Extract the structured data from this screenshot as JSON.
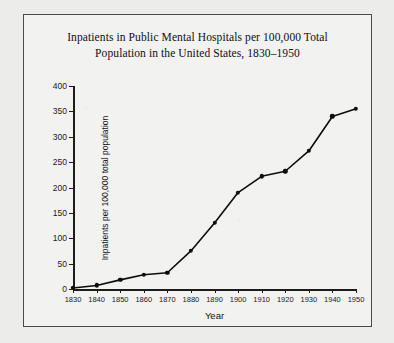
{
  "chart_data": {
    "type": "line",
    "title": "Inpatients in Public Mental Hospitals per 100,000 Total Population in the United States, 1830–1950",
    "title_lines": [
      "Inpatients in Public Mental Hospitals per 100,000 Total",
      "Population in the United States, 1830–1950"
    ],
    "xlabel": "Year",
    "ylabel": "Inpatients per 100,000 total population",
    "x": [
      1830,
      1840,
      1850,
      1860,
      1870,
      1880,
      1890,
      1900,
      1910,
      1920,
      1930,
      1940,
      1950
    ],
    "values": [
      2,
      7,
      18,
      28,
      32,
      75,
      130,
      190,
      222,
      232,
      272,
      340,
      355
    ],
    "xticks": [
      "1830",
      "1840",
      "1850",
      "1860",
      "1870",
      "1880",
      "1890",
      "1900",
      "1910",
      "1920",
      "1930",
      "1940",
      "1950"
    ],
    "yticks": [
      "0",
      "50",
      "100",
      "150",
      "200",
      "250",
      "300",
      "350",
      "400"
    ],
    "ytick_values": [
      0,
      50,
      100,
      150,
      200,
      250,
      300,
      350,
      400
    ],
    "xlim": [
      1830,
      1950
    ],
    "ylim": [
      0,
      400
    ],
    "grid": false,
    "legend": null,
    "marker": "filled-circle",
    "line_color": "#0c0c0c",
    "marker_color": "#0c0c0c",
    "background_color": "#f2f2f1",
    "frame_color": "#4a4a4a"
  }
}
